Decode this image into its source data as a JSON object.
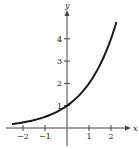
{
  "chart_data": {
    "type": "line",
    "title": "",
    "xlabel": "x",
    "ylabel": "y",
    "function": "y = 2^x",
    "xlim": [
      -2.5,
      2.25
    ],
    "ylim": [
      0,
      4.9
    ],
    "x_ticks": [
      -2,
      -1,
      1,
      2
    ],
    "x_tick_labels": [
      "−2",
      "−1",
      "1",
      "2"
    ],
    "y_ticks": [
      1,
      2,
      3,
      4
    ],
    "y_tick_labels": [
      "1",
      "2",
      "3",
      "4"
    ],
    "grid": false,
    "legend": null,
    "series": [
      {
        "name": "y = 2^x",
        "x": [
          -2.5,
          -2,
          -1.5,
          -1,
          -0.5,
          0,
          0.5,
          1,
          1.5,
          2,
          2.25
        ],
        "y": [
          0.18,
          0.25,
          0.35,
          0.5,
          0.71,
          1,
          1.41,
          2,
          2.83,
          4,
          4.76
        ],
        "color": "#1a1a1a"
      }
    ]
  },
  "colors": {
    "axis": "#444444",
    "curve": "#1a1a1a"
  }
}
